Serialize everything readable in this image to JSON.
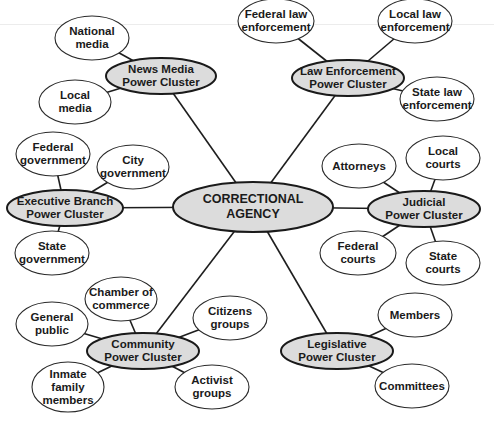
{
  "diagram": {
    "type": "hub-and-spoke mind map",
    "center": {
      "id": "center",
      "label": "CORRECTIONAL\nAGENCY",
      "x": 253,
      "y": 207,
      "rx": 80,
      "ry": 25
    },
    "clusters": [
      {
        "id": "news",
        "label": "News Media\nPower Cluster",
        "x": 161,
        "y": 76,
        "rx": 55,
        "ry": 18,
        "leaves": [
          {
            "id": "national-media",
            "label": "National\nmedia",
            "x": 92,
            "y": 38,
            "rx": 37,
            "ry": 22
          },
          {
            "id": "local-media",
            "label": "Local\nmedia",
            "x": 75,
            "y": 102,
            "rx": 36,
            "ry": 22
          }
        ]
      },
      {
        "id": "law",
        "label": "Law Enforcement\nPower Cluster",
        "x": 348,
        "y": 78,
        "rx": 56,
        "ry": 18,
        "leaves": [
          {
            "id": "federal-law",
            "label": "Federal law\nenforcement",
            "x": 276,
            "y": 21,
            "rx": 38,
            "ry": 22
          },
          {
            "id": "local-law",
            "label": "Local law\nenforcement",
            "x": 415,
            "y": 21,
            "rx": 37,
            "ry": 22
          },
          {
            "id": "state-law",
            "label": "State law\nenforcement",
            "x": 437,
            "y": 99,
            "rx": 37,
            "ry": 22
          }
        ]
      },
      {
        "id": "executive",
        "label": "Executive Branch\nPower Cluster",
        "x": 65,
        "y": 208,
        "rx": 58,
        "ry": 18,
        "leaves": [
          {
            "id": "federal-gov",
            "label": "Federal\ngovernment",
            "x": 53,
            "y": 154,
            "rx": 37,
            "ry": 22
          },
          {
            "id": "city-gov",
            "label": "City\ngovernment",
            "x": 133,
            "y": 167,
            "rx": 36,
            "ry": 22
          },
          {
            "id": "state-gov",
            "label": "State\ngovernment",
            "x": 52,
            "y": 253,
            "rx": 37,
            "ry": 22
          }
        ]
      },
      {
        "id": "judicial",
        "label": "Judicial\nPower Cluster",
        "x": 424,
        "y": 209,
        "rx": 56,
        "ry": 18,
        "leaves": [
          {
            "id": "attorneys",
            "label": "Attorneys",
            "x": 359,
            "y": 166,
            "rx": 37,
            "ry": 22
          },
          {
            "id": "local-courts",
            "label": "Local\ncourts",
            "x": 443,
            "y": 158,
            "rx": 37,
            "ry": 22
          },
          {
            "id": "federal-courts",
            "label": "Federal\ncourts",
            "x": 358,
            "y": 253,
            "rx": 38,
            "ry": 22
          },
          {
            "id": "state-courts",
            "label": "State\ncourts",
            "x": 443,
            "y": 263,
            "rx": 37,
            "ry": 22
          }
        ]
      },
      {
        "id": "community",
        "label": "Community\nPower Cluster",
        "x": 143,
        "y": 351,
        "rx": 56,
        "ry": 18,
        "leaves": [
          {
            "id": "chamber",
            "label": "Chamber of\ncommerce",
            "x": 121,
            "y": 299,
            "rx": 36,
            "ry": 22
          },
          {
            "id": "general-public",
            "label": "General\npublic",
            "x": 52,
            "y": 324,
            "rx": 36,
            "ry": 22
          },
          {
            "id": "citizens",
            "label": "Citizens\ngroups",
            "x": 230,
            "y": 318,
            "rx": 37,
            "ry": 22
          },
          {
            "id": "inmate-family",
            "label": "Inmate\nfamily\nmembers",
            "x": 68,
            "y": 387,
            "rx": 36,
            "ry": 25
          },
          {
            "id": "activist",
            "label": "Activist\ngroups",
            "x": 212,
            "y": 387,
            "rx": 37,
            "ry": 22
          }
        ]
      },
      {
        "id": "legislative",
        "label": "Legislative\nPower Cluster",
        "x": 337,
        "y": 351,
        "rx": 56,
        "ry": 18,
        "leaves": [
          {
            "id": "members",
            "label": "Members",
            "x": 415,
            "y": 315,
            "rx": 37,
            "ry": 22
          },
          {
            "id": "committees",
            "label": "Committees",
            "x": 412,
            "y": 386,
            "rx": 37,
            "ry": 22
          }
        ]
      }
    ]
  }
}
